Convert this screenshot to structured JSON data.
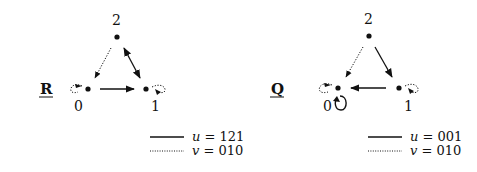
{
  "graphs": [
    {
      "name": "R",
      "nodes": [
        {
          "id": "0",
          "label": "0"
        },
        {
          "id": "1",
          "label": "1"
        },
        {
          "id": "2",
          "label": "2"
        }
      ],
      "edges": [
        {
          "from": "2",
          "to": "0",
          "style": "dotted"
        },
        {
          "from": "2",
          "to": "1",
          "style": "solid",
          "bidirectional": true
        },
        {
          "from": "0",
          "to": "1",
          "style": "solid"
        },
        {
          "from": "0",
          "to": "0",
          "style": "dotted"
        },
        {
          "from": "1",
          "to": "1",
          "style": "dotted"
        }
      ],
      "legend": [
        {
          "style": "solid",
          "var": "u",
          "eq": "= 121"
        },
        {
          "style": "dotted",
          "var": "v",
          "eq": "= 010"
        }
      ]
    },
    {
      "name": "Q",
      "nodes": [
        {
          "id": "0",
          "label": "0"
        },
        {
          "id": "1",
          "label": "1"
        },
        {
          "id": "2",
          "label": "2"
        }
      ],
      "edges": [
        {
          "from": "2",
          "to": "0",
          "style": "dotted"
        },
        {
          "from": "2",
          "to": "1",
          "style": "solid"
        },
        {
          "from": "1",
          "to": "0",
          "style": "solid"
        },
        {
          "from": "0",
          "to": "0",
          "style": "dotted"
        },
        {
          "from": "0",
          "to": "0",
          "style": "solid"
        },
        {
          "from": "1",
          "to": "1",
          "style": "dotted"
        }
      ],
      "legend": [
        {
          "style": "solid",
          "var": "u",
          "eq": "= 001"
        },
        {
          "style": "dotted",
          "var": "v",
          "eq": "= 010"
        }
      ]
    }
  ]
}
